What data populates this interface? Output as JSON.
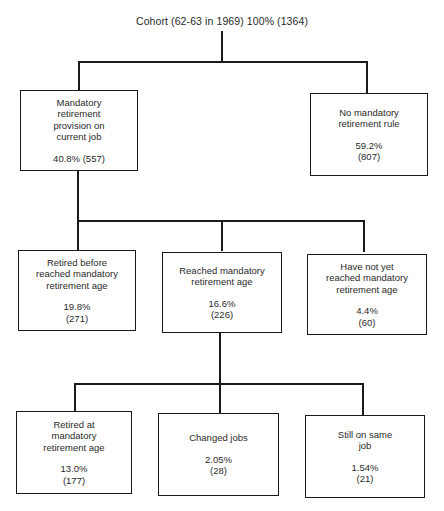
{
  "diagram": {
    "root": {
      "label": "Cohort (62-63 in 1969) 100% (1364)"
    },
    "level1": [
      {
        "label": "Mandatory\nretirement\nprovision on\ncurrent job",
        "stats": "40.8% (557)",
        "percent": "40.8%",
        "count": 557
      },
      {
        "label": "No mandatory\nretirement rule",
        "stats": "59.2%\n(807)",
        "percent": "59.2%",
        "count": 807
      }
    ],
    "level2": [
      {
        "label": "Retired before\nreached mandatory\nretirement age",
        "stats": "19.8%\n(271)",
        "percent": "19.8%",
        "count": 271
      },
      {
        "label": "Reached mandatory\nretirement age",
        "stats": "16.6%\n(226)",
        "percent": "16.6%",
        "count": 226
      },
      {
        "label": "Have not yet\nreached mandatory\nretirement age",
        "stats": "4.4%\n(60)",
        "percent": "4.4%",
        "count": 60
      }
    ],
    "level3": [
      {
        "label": "Retired at\nmandatory\nretirement age",
        "stats": "13.0%\n(177)",
        "percent": "13.0%",
        "count": 177
      },
      {
        "label": "Changed jobs",
        "stats": "2.05%\n(28)",
        "percent": "2.05%",
        "count": 28
      },
      {
        "label": "Still on same\njob",
        "stats": "1.54%\n(21)",
        "percent": "1.54%",
        "count": 21
      }
    ]
  },
  "colors": {
    "line": "#1a1a1a",
    "text": "#2a2a2a",
    "background": "#ffffff"
  }
}
